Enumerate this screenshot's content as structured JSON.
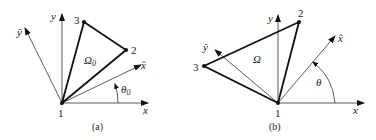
{
  "panels": [
    {
      "id": "a",
      "caption": "(a)",
      "axis_x": "x",
      "axis_y": "y",
      "rot_x": "x̂",
      "rot_y": "ŷ",
      "region": "Ω",
      "region_sub": "0",
      "angle": "θ",
      "angle_sub": "0",
      "nodes": [
        "1",
        "2",
        "3"
      ]
    },
    {
      "id": "b",
      "caption": "(b)",
      "axis_x": "x",
      "axis_y": "y",
      "rot_x": "x̂",
      "rot_y": "ŷ",
      "region": "Ω",
      "region_sub": "",
      "angle": "θ",
      "angle_sub": "",
      "nodes": [
        "1",
        "2",
        "3"
      ]
    }
  ]
}
